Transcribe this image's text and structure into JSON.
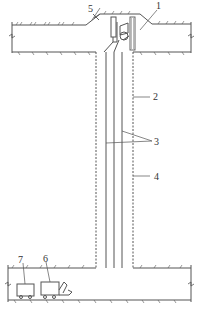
{
  "figure": {
    "labels": [
      {
        "id": "1",
        "text": "1"
      },
      {
        "id": "2",
        "text": "2"
      },
      {
        "id": "3",
        "text": "3"
      },
      {
        "id": "4",
        "text": "4"
      },
      {
        "id": "5",
        "text": "5"
      },
      {
        "id": "6",
        "text": "6"
      },
      {
        "id": "7",
        "text": "7"
      }
    ],
    "colors": {
      "line": "#555555",
      "background": "#ffffff"
    }
  }
}
